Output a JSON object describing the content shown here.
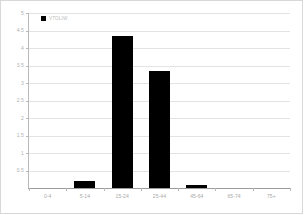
{
  "chart_data": {
    "type": "bar",
    "title": "",
    "subtitle": "",
    "xlabel": "",
    "ylabel": "",
    "categories": [
      "0-4",
      "5-14",
      "15-24",
      "25-44",
      "45-64",
      "65-74",
      "75+"
    ],
    "values": [
      0,
      0.2,
      4.35,
      3.35,
      0.1,
      0,
      0
    ],
    "series": [
      {
        "name": "VTOLIW",
        "color": "#000000",
        "values": [
          0,
          0.2,
          4.35,
          3.35,
          0.1,
          0,
          0
        ]
      }
    ],
    "ylim": [
      0,
      5
    ],
    "xlim_categories": 7,
    "y_ticks": [
      0.5,
      1,
      1.5,
      2,
      2.5,
      3,
      3.5,
      4,
      4.5,
      5
    ],
    "y_tick_labels": [
      "0.5",
      "1",
      "1.5",
      "2",
      "2.5",
      "3",
      "3.5",
      "4",
      "4.5",
      "5"
    ],
    "grid": "horizontal",
    "legend": {
      "position": "top-left-inside",
      "entries": [
        {
          "label": "VTOLIW",
          "color": "#000000"
        }
      ]
    },
    "colors": {
      "bar": "#000000",
      "gridline": "#e3e3e3",
      "axis": "#b9b9b9",
      "tick_label": "#b0b0b0",
      "background": "#ffffff",
      "frame": "#d8d8d8"
    }
  }
}
